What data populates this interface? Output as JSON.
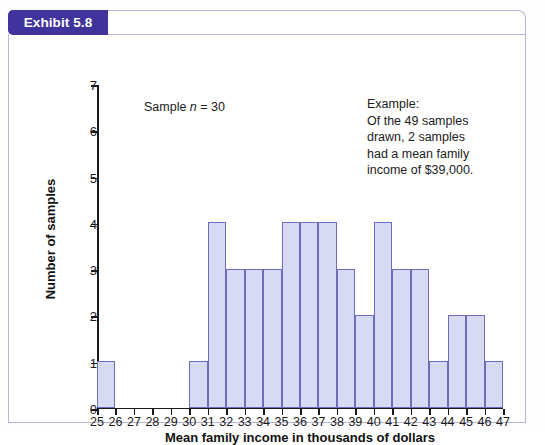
{
  "exhibit": {
    "badge_label": "Exhibit 5.8",
    "title": "Partial Sampling Distribution: Mean Family Income",
    "badge_color": "#40339b",
    "border_color": "#b9b4d8"
  },
  "annotations": {
    "sample_prefix": "Sample ",
    "sample_italic": "n",
    "sample_suffix": " = 30",
    "example_lines": [
      "Example:",
      "Of the 49 samples",
      "drawn, 2 samples",
      "had a mean family",
      "income of $39,000."
    ]
  },
  "chart_data": {
    "type": "bar",
    "title": "Partial Sampling Distribution: Mean Family Income",
    "xlabel": "Mean family income in thousands of dollars",
    "ylabel": "Number of samples",
    "xlim": [
      25,
      47
    ],
    "ylim": [
      0,
      7
    ],
    "grid": false,
    "legend": null,
    "bar_fill": "#d8d9f5",
    "bar_stroke": "#6e6cc0",
    "xticks": [
      25,
      26,
      27,
      28,
      29,
      30,
      31,
      32,
      33,
      34,
      35,
      36,
      37,
      38,
      39,
      40,
      41,
      42,
      43,
      44,
      45,
      46,
      47
    ],
    "yticks": [
      0,
      1,
      2,
      3,
      4,
      5,
      6,
      7
    ],
    "bin_starts": [
      25,
      26,
      27,
      28,
      29,
      30,
      31,
      32,
      33,
      34,
      35,
      36,
      37,
      38,
      39,
      40,
      41,
      42,
      43,
      44,
      45,
      46
    ],
    "bin_width": 1,
    "values": [
      1,
      0,
      0,
      0,
      0,
      1,
      4,
      3,
      3,
      3,
      4,
      4,
      4,
      3,
      2,
      4,
      3,
      3,
      1,
      2,
      2,
      1
    ],
    "total_samples": 49
  }
}
